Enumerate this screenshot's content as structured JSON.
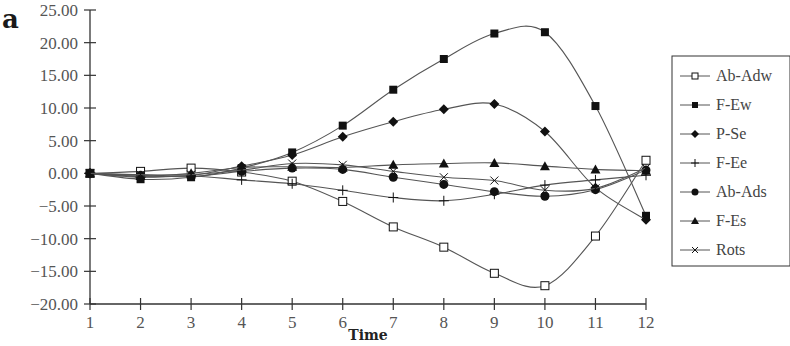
{
  "panel_label": "a",
  "chart_data": {
    "type": "line",
    "title": "",
    "xlabel": "Time",
    "ylabel": "",
    "x": [
      1,
      2,
      3,
      4,
      5,
      6,
      7,
      8,
      9,
      10,
      11,
      12
    ],
    "xlim": [
      1,
      12
    ],
    "ylim": [
      -20,
      25
    ],
    "yticks": [
      25,
      20,
      15,
      10,
      5,
      0,
      -5,
      -10,
      -15,
      -20
    ],
    "ytick_labels": [
      "25.00",
      "20.00",
      "15.00",
      "10.00",
      "5.00",
      "0.00",
      "-5.00",
      "-10.00",
      "-15.00",
      "-20.00"
    ],
    "xtick_labels": [
      "1",
      "2",
      "3",
      "4",
      "5",
      "6",
      "7",
      "8",
      "9",
      "10",
      "11",
      "12"
    ],
    "grid": false,
    "legend_position": "right",
    "series": [
      {
        "name": "Ab-Adw",
        "marker": "open-square",
        "values": [
          0,
          0.3,
          0.8,
          0.2,
          -1.2,
          -4.3,
          -8.2,
          -11.3,
          -15.3,
          -17.2,
          -9.6,
          2.0
        ]
      },
      {
        "name": "F-Ew",
        "marker": "filled-square",
        "values": [
          0,
          -0.9,
          -0.6,
          0.8,
          3.2,
          7.3,
          12.8,
          17.5,
          21.4,
          21.6,
          10.3,
          -6.5
        ]
      },
      {
        "name": "P-Se",
        "marker": "filled-diamond",
        "values": [
          0,
          -0.5,
          -0.3,
          1.1,
          2.8,
          5.6,
          7.9,
          9.8,
          10.6,
          6.4,
          -2.2,
          -7.1
        ]
      },
      {
        "name": "F-Ee",
        "marker": "plus",
        "values": [
          0,
          -0.6,
          -0.4,
          -1.0,
          -1.6,
          -2.6,
          -3.7,
          -4.2,
          -3.2,
          -1.8,
          -1.0,
          -0.3
        ]
      },
      {
        "name": "Ab-Ads",
        "marker": "filled-circle",
        "values": [
          0,
          -0.3,
          -0.5,
          0.3,
          0.8,
          0.6,
          -0.6,
          -1.7,
          -2.8,
          -3.5,
          -2.5,
          0.5
        ]
      },
      {
        "name": "F-Es",
        "marker": "filled-triangle",
        "values": [
          0,
          -0.4,
          0.0,
          0.9,
          1.0,
          0.9,
          1.3,
          1.5,
          1.6,
          1.1,
          0.6,
          0.4
        ]
      },
      {
        "name": "Rots",
        "marker": "x",
        "values": [
          0,
          -0.2,
          -0.2,
          0.5,
          1.5,
          1.3,
          0.3,
          -0.6,
          -1.1,
          -2.6,
          -2.3,
          0.8
        ]
      }
    ]
  },
  "colors": {
    "line": "#555555",
    "marker": "#111111",
    "axis": "#333333",
    "text": "#555555"
  }
}
